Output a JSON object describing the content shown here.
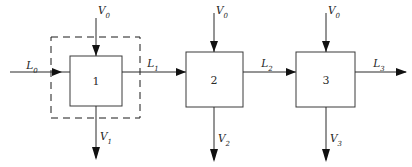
{
  "diagram": {
    "type": "process-flow-diagram",
    "stages": [
      {
        "id": "stage-1",
        "number": "1",
        "vapor_in_label": "V",
        "vapor_in_sub": "0",
        "vapor_out_label": "V",
        "vapor_out_sub": "1",
        "liquid_out_label": "L",
        "liquid_out_sub": "1",
        "enclosed_in_control_volume": true
      },
      {
        "id": "stage-2",
        "number": "2",
        "vapor_in_label": "V",
        "vapor_in_sub": "0",
        "vapor_out_label": "V",
        "vapor_out_sub": "2",
        "liquid_out_label": "L",
        "liquid_out_sub": "2",
        "enclosed_in_control_volume": false
      },
      {
        "id": "stage-3",
        "number": "3",
        "vapor_in_label": "V",
        "vapor_in_sub": "0",
        "vapor_out_label": "V",
        "vapor_out_sub": "3",
        "liquid_out_label": "L",
        "liquid_out_sub": "3",
        "enclosed_in_control_volume": false
      }
    ],
    "feed": {
      "label": "L",
      "sub": "0"
    },
    "colors": {
      "box_stroke": "#3a3a3a",
      "line": "#2b2b2b",
      "arrow": "#111111",
      "dashed_boundary": "#1a1a1a",
      "text": "#1d1d1d",
      "background": "#ffffff"
    }
  }
}
